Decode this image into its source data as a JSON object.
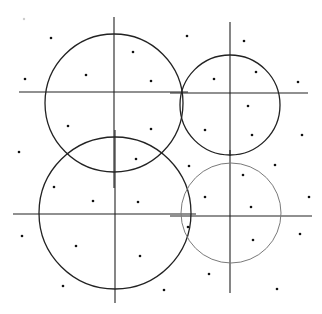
{
  "diagram": {
    "width": 322,
    "height": 314,
    "background": "#ffffff",
    "stroke_color": "#222222",
    "gray_stroke_color": "#7a7a7a",
    "dot_color": "#111111",
    "quadrants": [
      {
        "name": "top-left",
        "circle": {
          "cx": 114,
          "cy": 103,
          "r": 69,
          "color": "#222222",
          "width": 1.3
        },
        "h_line": {
          "x1": 19,
          "x2": 188,
          "y": 92
        },
        "v_line": {
          "x": 114,
          "y1": 17,
          "y2": 188
        }
      },
      {
        "name": "top-right",
        "circle": {
          "cx": 230,
          "cy": 105,
          "r": 50,
          "color": "#222222",
          "width": 1.3
        },
        "h_line": {
          "x1": 170,
          "x2": 308,
          "y": 93
        },
        "v_line": {
          "x": 230,
          "y1": 22,
          "y2": 156
        }
      },
      {
        "name": "bottom-left",
        "circle": {
          "cx": 115,
          "cy": 213,
          "r": 76,
          "color": "#222222",
          "width": 1.3
        },
        "h_line": {
          "x1": 13,
          "x2": 196,
          "y": 214
        },
        "v_line": {
          "x": 115,
          "y1": 130,
          "y2": 303
        }
      },
      {
        "name": "bottom-right",
        "circle": {
          "cx": 231,
          "cy": 213,
          "r": 50,
          "color": "#7a7a7a",
          "width": 1.0
        },
        "h_line": {
          "x1": 170,
          "x2": 312,
          "y": 216
        },
        "v_line": {
          "x": 230,
          "y1": 150,
          "y2": 293
        }
      }
    ],
    "points": [
      [
        51,
        38
      ],
      [
        133,
        52
      ],
      [
        25,
        79
      ],
      [
        86,
        75
      ],
      [
        151,
        81
      ],
      [
        68,
        126
      ],
      [
        151,
        129
      ],
      [
        19,
        152
      ],
      [
        187,
        36
      ],
      [
        244,
        41
      ],
      [
        256,
        72
      ],
      [
        214,
        79
      ],
      [
        298,
        82
      ],
      [
        248,
        106
      ],
      [
        205,
        130
      ],
      [
        252,
        135
      ],
      [
        302,
        135
      ],
      [
        136,
        159
      ],
      [
        189,
        166
      ],
      [
        54,
        187
      ],
      [
        93,
        201
      ],
      [
        138,
        202
      ],
      [
        22,
        236
      ],
      [
        76,
        246
      ],
      [
        140,
        256
      ],
      [
        63,
        286
      ],
      [
        275,
        165
      ],
      [
        243,
        175
      ],
      [
        205,
        197
      ],
      [
        309,
        197
      ],
      [
        251,
        207
      ],
      [
        188,
        227
      ],
      [
        300,
        234
      ],
      [
        253,
        240
      ],
      [
        209,
        274
      ],
      [
        164,
        290
      ],
      [
        277,
        289
      ]
    ],
    "faint_points": [
      [
        24,
        19
      ]
    ]
  }
}
